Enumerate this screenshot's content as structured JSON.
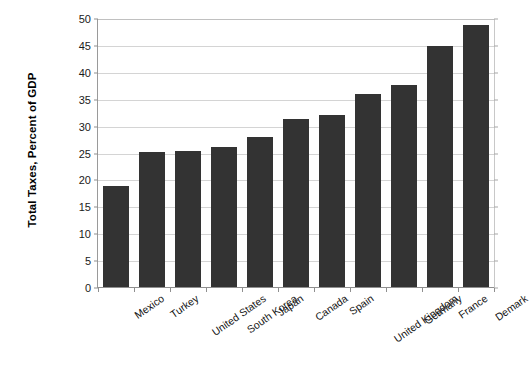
{
  "chart_data": {
    "type": "bar",
    "title": "",
    "xlabel": "",
    "ylabel": "Total Taxes, Percent of GDP",
    "ylim": [
      0,
      50
    ],
    "ytick_step": 5,
    "yticks": [
      0,
      5,
      10,
      15,
      20,
      25,
      30,
      35,
      40,
      45,
      50
    ],
    "grid": true,
    "legend": false,
    "bar_color": "#333333",
    "gridline_color": "#d4d4d4",
    "axis_color": "#8f8f8f",
    "categories": [
      "Mexico",
      "Turkey",
      "United States",
      "South Korea",
      "Japan",
      "Canada",
      "Spain",
      "United Kingdom",
      "Germany",
      "France",
      "Demark"
    ],
    "values": [
      19.0,
      25.3,
      25.4,
      26.3,
      28.0,
      31.5,
      32.1,
      36.0,
      37.8,
      45.0,
      48.8
    ]
  }
}
